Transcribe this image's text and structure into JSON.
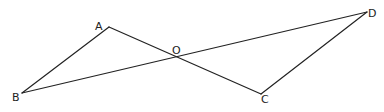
{
  "diagram": {
    "type": "geometry",
    "points": {
      "A": {
        "label": "A",
        "x": 109,
        "y": 27,
        "lx": 95,
        "ly": 30
      },
      "B": {
        "label": "B",
        "x": 22,
        "y": 93,
        "lx": 12,
        "ly": 101
      },
      "O": {
        "label": "O",
        "x": 176,
        "y": 57,
        "lx": 172,
        "ly": 54
      },
      "C": {
        "label": "C",
        "x": 261,
        "y": 94,
        "lx": 261,
        "ly": 103
      },
      "D": {
        "label": "D",
        "x": 367,
        "y": 12,
        "lx": 368,
        "ly": 17
      }
    },
    "segments": [
      {
        "from": "A",
        "to": "B"
      },
      {
        "from": "A",
        "to": "C"
      },
      {
        "from": "B",
        "to": "D"
      },
      {
        "from": "C",
        "to": "D"
      }
    ],
    "stroke_color": "#222222",
    "background": "#ffffff"
  }
}
